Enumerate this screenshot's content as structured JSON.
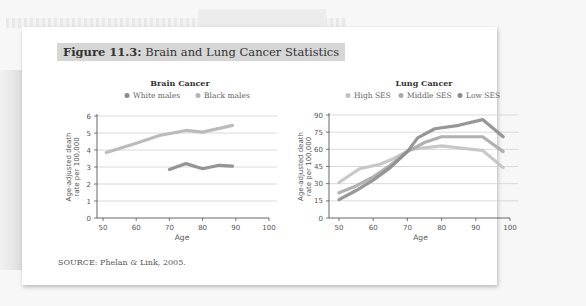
{
  "figure": {
    "label": "Figure 11.3:",
    "title": "Brain and Lung Cancer Statistics",
    "source": "SOURCE: Phelan & Link, 2005."
  },
  "colors": {
    "white_males": "#8a8a8a",
    "black_males": "#b4b4b4",
    "high_ses": "#c2c2c2",
    "middle_ses": "#a9a9a9",
    "low_ses": "#8c8c8c",
    "grid": "#d0d0d0",
    "axis": "#555555"
  },
  "chart_data": [
    {
      "type": "line",
      "title": "Brain Cancer",
      "xlabel": "Age",
      "ylabel": "Age-adjusted death rate per 100,000",
      "xlim": [
        50,
        100
      ],
      "ylim": [
        0,
        6
      ],
      "xticks": [
        50,
        60,
        70,
        80,
        90,
        100
      ],
      "yticks": [
        0,
        1,
        2,
        3,
        4,
        5,
        6
      ],
      "grid": true,
      "legend_position": "top",
      "series": [
        {
          "name": "White males",
          "x": [
            70,
            75,
            80,
            85,
            89
          ],
          "y": [
            2.85,
            3.2,
            2.9,
            3.1,
            3.05
          ]
        },
        {
          "name": "Black males",
          "x": [
            51,
            60,
            67,
            75,
            80,
            89
          ],
          "y": [
            3.85,
            4.4,
            4.85,
            5.15,
            5.05,
            5.45
          ]
        }
      ]
    },
    {
      "type": "line",
      "title": "Lung Cancer",
      "xlabel": "Age",
      "ylabel": "Age-adjusted death rate per 100,000",
      "xlim": [
        50,
        100
      ],
      "ylim": [
        0,
        90
      ],
      "xticks": [
        50,
        60,
        70,
        80,
        90,
        100
      ],
      "yticks": [
        0,
        15,
        30,
        45,
        60,
        75,
        90
      ],
      "grid": true,
      "legend_position": "top",
      "series": [
        {
          "name": "High SES",
          "x": [
            50,
            56,
            62,
            66,
            71,
            80,
            92,
            98
          ],
          "y": [
            31,
            43,
            47,
            52,
            60,
            63,
            59,
            44
          ]
        },
        {
          "name": "Middle SES",
          "x": [
            50,
            55,
            60,
            65,
            70,
            75,
            80,
            92,
            98
          ],
          "y": [
            22,
            28,
            36,
            46,
            58,
            66,
            71,
            71,
            58
          ]
        },
        {
          "name": "Low SES",
          "x": [
            50,
            55,
            60,
            65,
            70,
            73,
            78,
            85,
            92,
            98
          ],
          "y": [
            16,
            24,
            33,
            44,
            58,
            70,
            78,
            81,
            86,
            71
          ]
        }
      ]
    }
  ]
}
